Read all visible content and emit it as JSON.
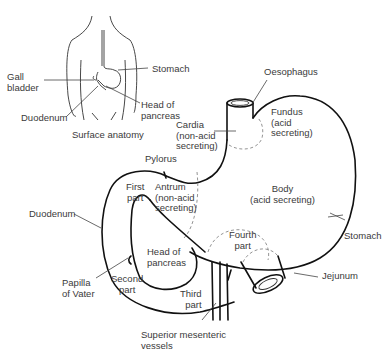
{
  "inset": {
    "caption": "Surface anatomy",
    "labels": {
      "gall_bladder": "Gall\nbladder",
      "stomach": "Stomach",
      "duodenum": "Duodenum",
      "head_of_pancreas": "Head of\npancreas"
    }
  },
  "main": {
    "labels": {
      "oesophagus": "Oesophagus",
      "cardia": "Cardia\n(non-acid\nsecreting)",
      "fundus": "Fundus\n(acid\nsecreting)",
      "pylorus": "Pylorus",
      "first_part": "First\npart",
      "antrum": "Antrum\n(non-acid\nsecreting)",
      "body": "Body\n(acid secreting)",
      "duodenum": "Duodenum",
      "fourth_part": "Fourth\npart",
      "stomach": "Stomach",
      "head_of_pancreas": "Head of\npancreas",
      "jejunum": "Jejunum",
      "papilla_of_vater": "Papilla\nof Vater",
      "second_part": "Second\npart",
      "third_part": "Third\npart",
      "superior_mesenteric_vessels": "Superior mesenteric\nvessels"
    }
  }
}
